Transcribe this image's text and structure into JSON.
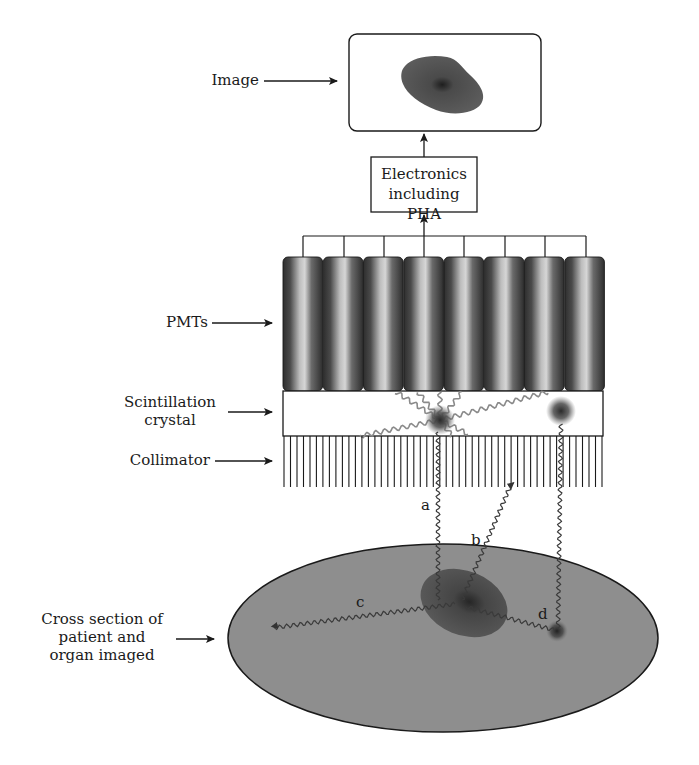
{
  "diagram": {
    "labels": {
      "image": "Image",
      "pmts": "PMTs",
      "crystal_line1": "Scintillation",
      "crystal_line2": "crystal",
      "collimator": "Collimator",
      "patient_line1": "Cross section of",
      "patient_line2": "patient and",
      "patient_line3": "organ imaged"
    },
    "electronics_box": {
      "line1": "Electronics",
      "line2": "including PHA"
    },
    "rays": {
      "a": "a",
      "b": "b",
      "c": "c",
      "d": "d"
    },
    "components": {
      "pmt_count": 8,
      "collimator_septa": 50
    },
    "colors": {
      "line": "#1a1a1a",
      "patient_fill": "#8c8c8c",
      "organ_fill": "#555555",
      "pmt_dark": "#3a3a3a",
      "pmt_light": "#c8c8c8",
      "ray": "#4a4a4a",
      "light_ray": "#8a8a8a"
    }
  }
}
